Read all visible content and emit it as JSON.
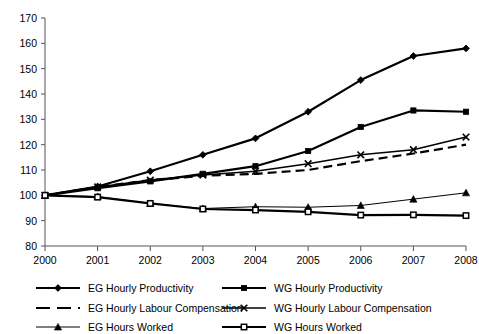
{
  "chart_data": {
    "type": "line",
    "title": "",
    "subtitle": "",
    "xlabel": "",
    "ylabel": "",
    "grid": false,
    "legend_position": "bottom",
    "x": [
      2000,
      2001,
      2002,
      2003,
      2004,
      2005,
      2006,
      2007,
      2008
    ],
    "categories": [
      "2000",
      "2001",
      "2002",
      "2003",
      "2004",
      "2005",
      "2006",
      "2007",
      "2008"
    ],
    "xlim": [
      2000,
      2008
    ],
    "ylim": [
      80,
      170
    ],
    "ytick_labels": [
      "80",
      "90",
      "100",
      "110",
      "120",
      "130",
      "140",
      "150",
      "160",
      "170"
    ],
    "yticks": [
      80,
      90,
      100,
      110,
      120,
      130,
      140,
      150,
      160,
      170
    ],
    "series": [
      {
        "name": "EG Hourly Productivity",
        "marker": "filled-diamond",
        "line": "solid",
        "color": "#000000",
        "width": 2.2,
        "values": [
          100,
          103.5,
          109.5,
          116,
          122.5,
          133,
          145.5,
          155,
          158
        ]
      },
      {
        "name": "WG Hourly Productivity",
        "marker": "filled-square",
        "line": "solid",
        "color": "#000000",
        "width": 2.2,
        "values": [
          100,
          102.8,
          105.5,
          108.5,
          111.5,
          117.5,
          127,
          133.5,
          133
        ]
      },
      {
        "name": "EG Hourly Labour Compensation",
        "marker": "none",
        "line": "dashed",
        "color": "#000000",
        "width": 2.2,
        "values": [
          100,
          103.3,
          106,
          107.7,
          108.5,
          110,
          113.5,
          116.5,
          120
        ]
      },
      {
        "name": "WG Hourly Labour Compensation",
        "marker": "cross",
        "line": "solid",
        "color": "#000000",
        "width": 1.6,
        "values": [
          100,
          103.3,
          106,
          108,
          109.5,
          112.5,
          116,
          118,
          123
        ]
      },
      {
        "name": "EG Hours Worked",
        "marker": "filled-triangle",
        "line": "solid",
        "color": "#000000",
        "width": 1.0,
        "values": [
          100,
          99.5,
          96.8,
          94.8,
          95.5,
          95.3,
          96,
          98.5,
          101
        ]
      },
      {
        "name": "WG Hours Worked",
        "marker": "open-square",
        "line": "solid",
        "color": "#000000",
        "width": 2.2,
        "values": [
          100,
          99.3,
          96.8,
          94.6,
          94.2,
          93.5,
          92.2,
          92.3,
          92
        ]
      }
    ]
  },
  "legend": {
    "entries": [
      {
        "label": "EG Hourly Productivity"
      },
      {
        "label": "WG Hourly Productivity"
      },
      {
        "label": "EG Hourly Labour Compensation"
      },
      {
        "label": "WG Hourly Labour Compensation"
      },
      {
        "label": "EG Hours Worked"
      },
      {
        "label": "WG Hours Worked"
      }
    ]
  }
}
